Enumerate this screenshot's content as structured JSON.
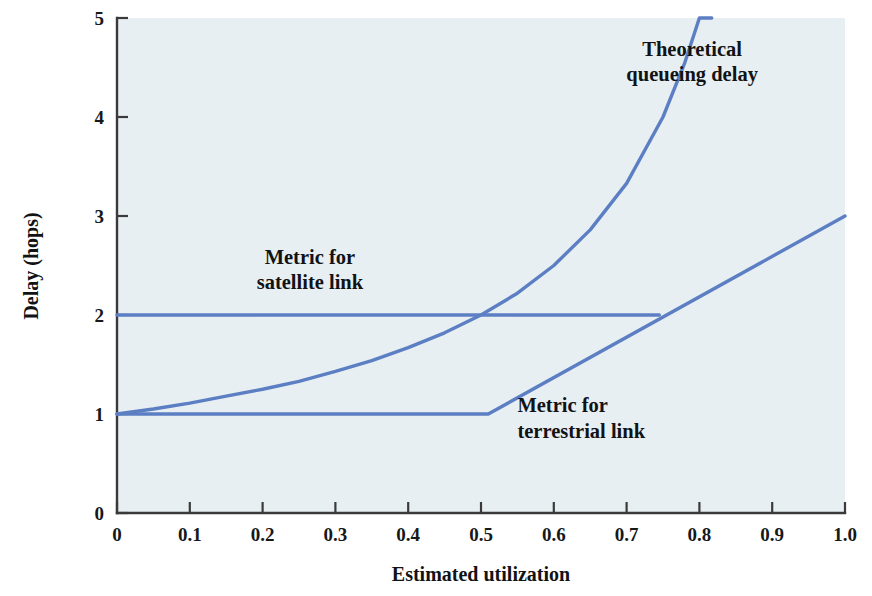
{
  "chart_data": {
    "type": "line",
    "title": "",
    "xlabel": "Estimated utilization",
    "ylabel": "Delay (hops)",
    "xlim": [
      0,
      1.0
    ],
    "ylim": [
      0,
      5
    ],
    "grid": false,
    "legend_position": "inline-annotations",
    "x_ticks": [
      "0",
      "0.1",
      "0.2",
      "0.3",
      "0.4",
      "0.5",
      "0.6",
      "0.7",
      "0.8",
      "0.9",
      "1.0"
    ],
    "x_tick_values": [
      0,
      0.1,
      0.2,
      0.3,
      0.4,
      0.5,
      0.6,
      0.7,
      0.8,
      0.9,
      1.0
    ],
    "y_ticks": [
      "0",
      "1",
      "2",
      "3",
      "4",
      "5"
    ],
    "y_tick_values": [
      0,
      1,
      2,
      3,
      4,
      5
    ],
    "series": [
      {
        "name": "Metric for satellite link",
        "color": "#5c7fc4",
        "x": [
          0.0,
          0.745
        ],
        "values": [
          2.0,
          2.0
        ]
      },
      {
        "name": "Metric for terrestrial link",
        "color": "#5c7fc4",
        "x": [
          0.0,
          0.51,
          1.0
        ],
        "values": [
          1.0,
          1.0,
          3.0
        ]
      },
      {
        "name": "Theoretical queueing delay",
        "color": "#5c7fc4",
        "x": [
          0.0,
          0.05,
          0.1,
          0.15,
          0.2,
          0.25,
          0.3,
          0.35,
          0.4,
          0.45,
          0.5,
          0.55,
          0.6,
          0.65,
          0.7,
          0.75,
          0.78,
          0.8,
          0.817
        ],
        "values": [
          1.0,
          1.05,
          1.11,
          1.18,
          1.25,
          1.33,
          1.43,
          1.54,
          1.67,
          1.82,
          2.0,
          2.22,
          2.5,
          2.86,
          3.33,
          4.0,
          4.55,
          5.0,
          5.0
        ]
      }
    ],
    "annotations": [
      {
        "name": "theoretical-queueing-delay-label",
        "lines": [
          "Theoretical",
          "queueing delay"
        ],
        "x": 0.79,
        "y": 4.62
      },
      {
        "name": "metric-for-satellite-link-label",
        "lines": [
          "Metric for",
          "satellite link"
        ],
        "x": 0.265,
        "y": 2.52
      },
      {
        "name": "metric-for-terrestrial-link-label",
        "lines": [
          "Metric for",
          "terrestrial link"
        ],
        "x": 0.55,
        "y": 1.02
      }
    ]
  },
  "colors": {
    "series_blue": "#5c7fc4",
    "plot_background": "#e8eff3",
    "axis": "#3a3a3a",
    "text": "#111315",
    "page_background": "#ffffff"
  }
}
